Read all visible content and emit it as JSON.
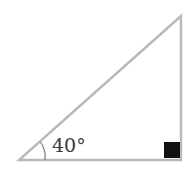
{
  "diagram": {
    "type": "right-triangle",
    "angle_label": "40°",
    "colors": {
      "stroke": "#b8b8b8",
      "right_angle_marker": "#111111",
      "label": "#3a3a3a",
      "background": "#ffffff"
    }
  }
}
